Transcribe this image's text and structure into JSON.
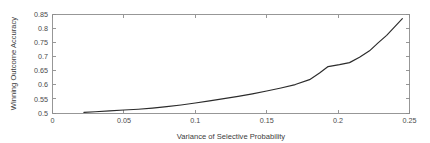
{
  "chart_data": {
    "type": "line",
    "title": "",
    "xlabel": "Variance of Selective Probability",
    "ylabel": "Winning Outcome Accuracy",
    "xlim": [
      0,
      0.25
    ],
    "ylim": [
      0.5,
      0.85
    ],
    "xticks": [
      0,
      0.05,
      0.1,
      0.15,
      0.2,
      0.25
    ],
    "xticklabels": [
      "0",
      "0.05",
      "0.1",
      "0.15",
      "0.2",
      "0.25"
    ],
    "yticks": [
      0.5,
      0.55,
      0.6,
      0.65,
      0.7,
      0.75,
      0.8,
      0.85
    ],
    "yticklabels": [
      "0.5",
      "0.55",
      "0.6",
      "0.65",
      "0.7",
      "0.75",
      "0.8",
      "0.85"
    ],
    "grid": false,
    "legend": false,
    "line_color": "#2b2b2b",
    "axis_color": "#8c8c8c",
    "background_color": "#ffffff",
    "series": [
      {
        "name": "Winning Outcome Accuracy",
        "x": [
          0.022,
          0.03,
          0.04,
          0.05,
          0.06,
          0.07,
          0.08,
          0.09,
          0.1,
          0.11,
          0.12,
          0.13,
          0.14,
          0.15,
          0.16,
          0.17,
          0.18,
          0.187,
          0.193,
          0.201,
          0.208,
          0.215,
          0.222,
          0.228,
          0.234,
          0.245
        ],
        "y": [
          0.502,
          0.5045,
          0.5075,
          0.5105,
          0.5135,
          0.5175,
          0.5225,
          0.5285,
          0.5355,
          0.543,
          0.551,
          0.559,
          0.568,
          0.578,
          0.589,
          0.601,
          0.6185,
          0.642,
          0.665,
          0.672,
          0.679,
          0.698,
          0.721,
          0.749,
          0.776,
          0.835
        ]
      }
    ]
  },
  "axes": {
    "x_title": "Variance of Selective Probability",
    "y_title": "Winning Outcome Accuracy"
  }
}
